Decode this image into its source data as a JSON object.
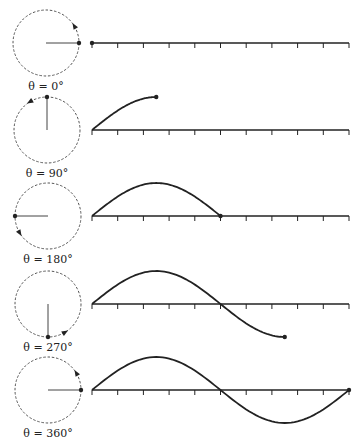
{
  "figure": {
    "colors": {
      "ink": "#222222",
      "circle": "#555555",
      "background": "#ffffff"
    },
    "axis": {
      "x_start": 92,
      "x_end": 349,
      "ticks": 10
    },
    "radius": 33,
    "panels": [
      {
        "label": "θ = 0°",
        "angle_deg": 0,
        "cx": 46,
        "cy": 43
      },
      {
        "label": "θ = 90°",
        "angle_deg": 90,
        "cx": 47,
        "cy": 130
      },
      {
        "label": "θ = 180°",
        "angle_deg": 180,
        "cx": 48,
        "cy": 216
      },
      {
        "label": "θ = 270°",
        "angle_deg": 270,
        "cx": 48,
        "cy": 304
      },
      {
        "label": "θ = 360°",
        "angle_deg": 360,
        "cx": 48,
        "cy": 390
      }
    ]
  },
  "chart_data": {
    "type": "line",
    "title": "",
    "xlabel": "θ (degrees)",
    "ylabel": "",
    "x_range": [
      0,
      360
    ],
    "y_range": [
      -1,
      1
    ],
    "grid": false,
    "ticks": 10,
    "series": [
      {
        "name": "θ = 0°",
        "end_deg": 0,
        "end_value": 0
      },
      {
        "name": "θ = 90°",
        "end_deg": 90,
        "end_value": 1
      },
      {
        "name": "θ = 180°",
        "end_deg": 180,
        "end_value": 0
      },
      {
        "name": "θ = 270°",
        "end_deg": 270,
        "end_value": -1
      },
      {
        "name": "θ = 360°",
        "end_deg": 360,
        "end_value": 0
      }
    ],
    "function": "sin(θ)"
  }
}
